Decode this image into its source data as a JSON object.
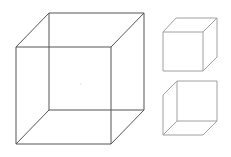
{
  "figure": {
    "title": "Necker cube and its two interpretations",
    "colors": {
      "background": "#ffffff",
      "big_cube_stroke": "#555555",
      "small_cube_stroke": "#a0a0a0",
      "center_dot": "#dddddd"
    },
    "big_cube": {
      "front": [
        [
          16,
          47
        ],
        [
          111,
          47
        ],
        [
          111,
          144
        ],
        [
          16,
          144
        ]
      ],
      "back": [
        [
          49,
          13
        ],
        [
          144,
          13
        ],
        [
          144,
          110
        ],
        [
          49,
          110
        ]
      ],
      "center_dot": [
        81,
        84
      ]
    },
    "small_cube_top": {
      "interpretation": "viewed from above",
      "front": [
        [
          163,
          32
        ],
        [
          203,
          32
        ],
        [
          203,
          71
        ],
        [
          163,
          71
        ]
      ],
      "back_visible": [
        [
          176,
          18
        ],
        [
          217,
          18
        ],
        [
          217,
          57
        ]
      ]
    },
    "small_cube_bottom": {
      "interpretation": "viewed from below",
      "square": [
        [
          177,
          81
        ],
        [
          217,
          81
        ],
        [
          217,
          121
        ],
        [
          177,
          121
        ]
      ],
      "front_visible": [
        [
          163,
          95
        ],
        [
          163,
          135
        ],
        [
          203,
          135
        ]
      ]
    }
  }
}
